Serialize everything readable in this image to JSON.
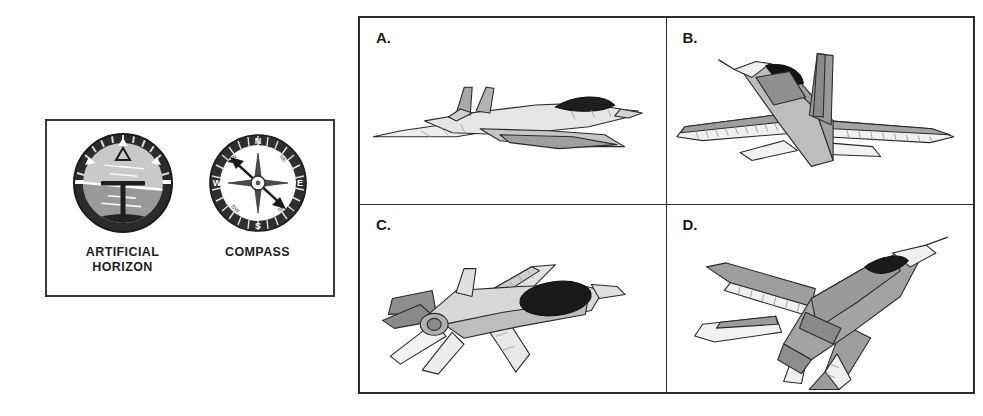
{
  "instrument_panel": {
    "instruments": [
      {
        "id": "artificial-horizon",
        "label": "ARTIFICIAL\nHORIZON",
        "type": "attitude-indicator",
        "bezel_color": "#2b2b2b",
        "sky_color": "#c9c9c9",
        "ground_color": "#9a9a9a",
        "horizon_line_color": "#ffffff",
        "bank_angle_deg": 5,
        "markers": [
          "top-triangle",
          "left-45-triangle",
          "right-45-triangle"
        ]
      },
      {
        "id": "compass",
        "label": "COMPASS",
        "type": "magnetic-compass",
        "bezel_color": "#2f2f2f",
        "cardinal_points": [
          "N",
          "E",
          "S",
          "W"
        ],
        "intercardinal_points": [
          "NW",
          "NE",
          "SE",
          "SW"
        ],
        "needle_heading": "NW-SE",
        "needle_color": "#1a1a1a"
      }
    ]
  },
  "aircraft_grid": {
    "cells": [
      {
        "id": "a",
        "letter": "A.",
        "caption": "jet in level flight, side view, delta wing with twin canted tail fins",
        "attitude": "level"
      },
      {
        "id": "b",
        "letter": "B.",
        "caption": "jet viewed from behind and above, tail fin prominent, wings swept",
        "attitude": "diving-away"
      },
      {
        "id": "c",
        "letter": "C.",
        "caption": "jet climbing to the upper right, canopy visible from above",
        "attitude": "climbing"
      },
      {
        "id": "d",
        "letter": "D.",
        "caption": "jet banking and rolling, top-down view, nose up to the right",
        "attitude": "banking"
      }
    ]
  },
  "colors": {
    "background": "#ffffff",
    "border": "#2b2b2b",
    "body_light": "#ededed",
    "body_mid": "#c8c8c8",
    "body_dark": "#9a9a9a",
    "canopy": "#1e1e1e",
    "outline": "#2a2a2a"
  }
}
